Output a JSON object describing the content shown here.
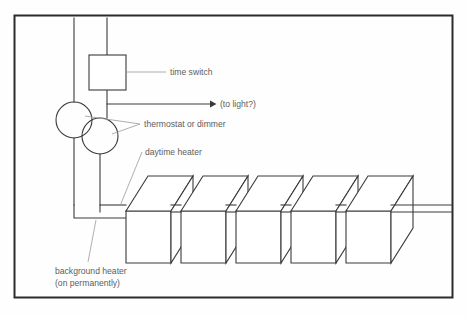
{
  "figure": {
    "kind": "technical-line-diagram",
    "background_color": "#fefefe",
    "border_color": "#2b2b2b",
    "line_color": "#3a3a3a",
    "label_color": "#5d5d5d"
  },
  "labels": {
    "time_switch": "time switch",
    "to_light": "(to light?)",
    "thermostat_or_dimmer": "thermostat or dimmer",
    "daytime_heater": "daytime heater",
    "background_heater_line1": "background heater",
    "background_heater_line2": "(on permanently)"
  },
  "components": {
    "time_switch_box": {
      "x": 89,
      "y": 55,
      "w": 37,
      "h": 35
    },
    "circles": [
      {
        "name": "thermostat-circle-left",
        "cx": 74,
        "cy": 120,
        "r": 18
      },
      {
        "name": "thermostat-circle-right",
        "cx": 100,
        "cy": 136,
        "r": 18
      }
    ],
    "heater_count": 5,
    "heater_boxes": [
      {
        "index": 1,
        "front_x": 126,
        "front_y": 211,
        "front_w": 45,
        "front_h": 52
      },
      {
        "index": 2,
        "front_x": 181,
        "front_y": 211,
        "front_w": 45,
        "front_h": 52
      },
      {
        "index": 3,
        "front_x": 236,
        "front_y": 211,
        "front_w": 45,
        "front_h": 52
      },
      {
        "index": 4,
        "front_x": 291,
        "front_y": 211,
        "front_w": 45,
        "front_h": 52
      },
      {
        "index": 5,
        "front_x": 346,
        "front_y": 211,
        "front_w": 45,
        "front_h": 52
      }
    ],
    "wires": {
      "upper_bus_y": 205,
      "lower_bus_y": 212,
      "left_vertical_x": 74,
      "right_vertical_x": 100,
      "bus_end_x": 452,
      "light_arrow_y": 104,
      "light_arrow_end_x": 214
    }
  }
}
